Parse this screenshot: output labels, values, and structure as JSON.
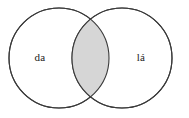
{
  "figure": {
    "type": "venn-diagram",
    "background_color": "#ffffff",
    "width": 189,
    "height": 118
  },
  "diagram": {
    "left_set": {
      "label": "da",
      "center_x": 59,
      "center_y": 58,
      "radius": 50,
      "fill_color": "#ffffff",
      "stroke_color": "#3a3a3a"
    },
    "right_set": {
      "label": "lá",
      "center_x": 122,
      "center_y": 58,
      "radius": 50,
      "fill_color": "#ffffff",
      "stroke_color": "#3a3a3a"
    },
    "intersection": {
      "label": "",
      "fill_color": "#d6d6d6",
      "stroke_color": "#2b2b2b",
      "highlighted": true
    },
    "stroke_width": 1.1
  },
  "labels": {
    "left_x": 40,
    "left_y": 58,
    "right_x": 141,
    "right_y": 58
  }
}
